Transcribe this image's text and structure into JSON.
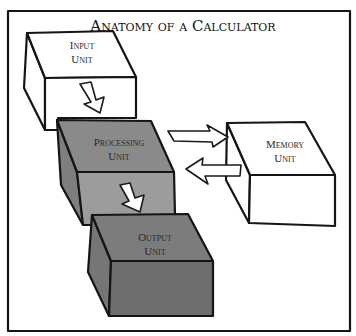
{
  "diagram": {
    "title": "Anatomy of a Calculator",
    "colors": {
      "frame": "#1a1a1a",
      "background": "#ffffff",
      "input_fill": "#ffffff",
      "memory_fill": "#ffffff",
      "processing_top": "#8a8a8a",
      "processing_front": "#9c9c9c",
      "processing_side": "#7e7e7e",
      "output_top": "#7c7c7c",
      "output_front": "#6e6e6e",
      "output_side": "#767676",
      "arrow_fill": "#ffffff"
    },
    "nodes": [
      {
        "id": "input",
        "line1": "Input",
        "line2": "Unit",
        "shade": "white"
      },
      {
        "id": "processing",
        "line1": "Processing",
        "line2": "Unit",
        "shade": "gray"
      },
      {
        "id": "memory",
        "line1": "Memory",
        "line2": "Unit",
        "shade": "white"
      },
      {
        "id": "output",
        "line1": "Output",
        "line2": "Unit",
        "shade": "dark-gray"
      }
    ],
    "edges": [
      {
        "from": "input",
        "to": "processing",
        "direction": "down"
      },
      {
        "from": "processing",
        "to": "memory",
        "direction": "right"
      },
      {
        "from": "memory",
        "to": "processing",
        "direction": "left"
      },
      {
        "from": "processing",
        "to": "output",
        "direction": "down"
      }
    ]
  }
}
